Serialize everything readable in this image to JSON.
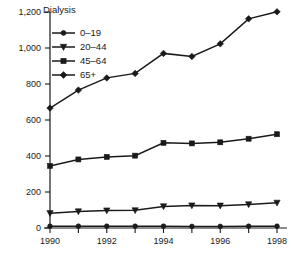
{
  "chart_data": {
    "type": "line",
    "title": "Dialysis",
    "xlabel": "",
    "ylabel": "",
    "x": [
      1990,
      1991,
      1992,
      1993,
      1994,
      1995,
      1996,
      1997,
      1998
    ],
    "xlim": [
      1990,
      1998
    ],
    "ylim": [
      0,
      1200
    ],
    "grid": false,
    "legend_position": "upper-left-inside",
    "y_ticks": [
      0,
      200,
      400,
      600,
      800,
      1000,
      1200
    ],
    "y_tick_labels": [
      "0",
      "200",
      "400",
      "600",
      "800",
      "1,000",
      "1,200"
    ],
    "x_ticks": [
      1990,
      1991,
      1992,
      1993,
      1994,
      1995,
      1996,
      1997,
      1998
    ],
    "x_tick_labels": [
      "1990",
      "",
      "1992",
      "",
      "1994",
      "",
      "1996",
      "",
      "1998"
    ],
    "series": [
      {
        "name": "0–19",
        "marker": "circle",
        "values": [
          10,
          10,
          10,
          10,
          10,
          9,
          9,
          10,
          10
        ]
      },
      {
        "name": "20–44",
        "marker": "triangle-down",
        "values": [
          82,
          92,
          97,
          98,
          120,
          125,
          124,
          131,
          140
        ]
      },
      {
        "name": "45–64",
        "marker": "square",
        "values": [
          345,
          381,
          395,
          402,
          473,
          470,
          476,
          496,
          521
        ]
      },
      {
        "name": "65+",
        "marker": "diamond",
        "values": [
          666,
          766,
          834,
          859,
          970,
          953,
          1023,
          1162,
          1201
        ]
      }
    ],
    "colors": {
      "ink": "#1a1a1a",
      "background": "#ffffff"
    }
  }
}
